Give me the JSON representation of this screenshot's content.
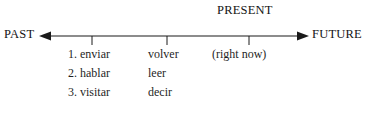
{
  "diagram": {
    "type": "timeline",
    "title_caption": "PRESENT",
    "axis": {
      "left_endpoint_label": "PAST",
      "right_endpoint_label": "FUTURE",
      "left_arrow": "arrow-left",
      "right_arrow": "arrow-right",
      "line_color": "#1a1a1a",
      "tick_count": 3,
      "tick_positions_px": [
        92,
        167,
        249
      ]
    },
    "columns": [
      {
        "name": "past-verbs",
        "tick_index": 0,
        "items": [
          "1. enviar",
          "2. hablar",
          "3. visitar"
        ]
      },
      {
        "name": "present-verbs",
        "tick_index": 1,
        "items": [
          "volver",
          "leer",
          "decir"
        ]
      },
      {
        "name": "present-moment",
        "tick_index": 2,
        "items": [
          "(right now)"
        ]
      }
    ]
  },
  "colors": {
    "ink": "#1a1a1a",
    "background": "#ffffff"
  }
}
